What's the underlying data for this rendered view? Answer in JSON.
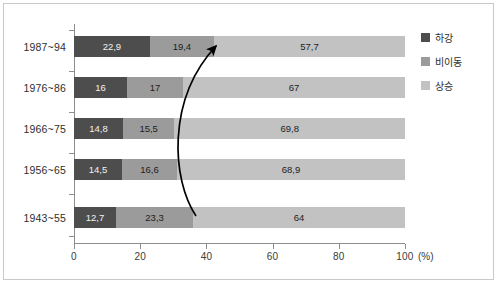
{
  "chart_data": {
    "type": "bar",
    "orientation": "horizontal",
    "stacked": true,
    "normalized_percent": true,
    "title": "",
    "subtitle": "",
    "xlabel": "",
    "ylabel": "",
    "unit_label": "(%)",
    "xlim": [
      0,
      100
    ],
    "xticks": [
      0,
      20,
      40,
      60,
      80,
      100
    ],
    "xtick_labels": [
      "0",
      "20",
      "40",
      "60",
      "80",
      "100"
    ],
    "grid": false,
    "legend_position": "right",
    "categories": [
      "1987~94",
      "1976~86",
      "1966~75",
      "1956~65",
      "1943~55"
    ],
    "series": [
      {
        "name": "하강",
        "color": "#4d4d4d",
        "values": [
          22.9,
          16,
          14.8,
          14.5,
          12.7
        ],
        "labels": [
          "22,9",
          "16",
          "14,8",
          "14,5",
          "12,7"
        ]
      },
      {
        "name": "비이동",
        "color": "#9b9b9b",
        "values": [
          19.4,
          17,
          15.5,
          16.6,
          23.3
        ],
        "labels": [
          "19,4",
          "17",
          "15,5",
          "16,6",
          "23,3"
        ]
      },
      {
        "name": "상승",
        "color": "#c2c2c2",
        "values": [
          57.7,
          67,
          69.8,
          68.9,
          64
        ],
        "labels": [
          "57,7",
          "67",
          "69,8",
          "68,9",
          "64"
        ]
      }
    ],
    "annotations": [
      {
        "name": "upward-trend-arrow",
        "type": "curved-arrow",
        "from": [
          196,
          216
        ],
        "to": [
          222,
          41
        ],
        "color": "#000000"
      }
    ]
  },
  "legend": {
    "items": [
      {
        "label": "하강",
        "color": "#4d4d4d"
      },
      {
        "label": "비이동",
        "color": "#9b9b9b"
      },
      {
        "label": "상승",
        "color": "#c2c2c2"
      }
    ]
  }
}
